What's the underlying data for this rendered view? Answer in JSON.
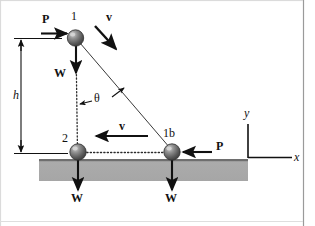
{
  "figure": {
    "type": "physics-free-body-diagram",
    "background_color": "#ffffff",
    "border_color": "#888888",
    "ink_color": "#111111",
    "slab_fill": "#a9a9a9",
    "slab_edge": "#6e6e6e",
    "ball_fill": "#5e5e5e",
    "ball_highlight": "#c8c8c8"
  },
  "labels": {
    "position_1": "1",
    "position_2": "2",
    "position_1b": "1b",
    "height": "h",
    "angle": "θ",
    "axis_x": "x",
    "axis_y": "y",
    "force_p_top": "P",
    "force_p_right": "P",
    "velocity_top": "v",
    "velocity_middle": "v",
    "weight_top": "W",
    "weight_bottom_left": "W",
    "weight_bottom_right": "W"
  },
  "geometry": {
    "ball_radius": 8,
    "ball_1": {
      "x": 75,
      "y": 38
    },
    "ball_2": {
      "x": 78,
      "y": 152
    },
    "ball_1b": {
      "x": 172,
      "y": 152
    },
    "slab": {
      "x": 39,
      "y": 159,
      "width": 209,
      "height": 22
    },
    "height_dimension": {
      "x": 21,
      "y_top": 38,
      "y_bottom": 153
    },
    "origin": {
      "x": 248,
      "y": 158
    }
  }
}
